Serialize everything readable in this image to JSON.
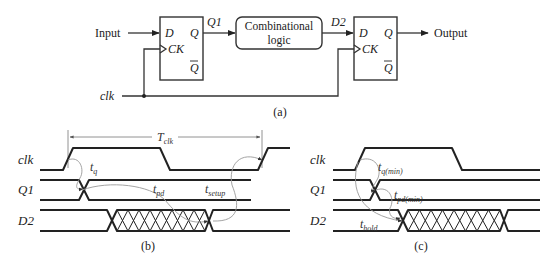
{
  "circuit": {
    "input_label": "Input",
    "output_label": "Output",
    "clk_label": "clk",
    "ff1": {
      "d": "D",
      "q": "Q",
      "ck": "CK",
      "qbar": "Q"
    },
    "ff2": {
      "d": "D",
      "q": "Q",
      "ck": "CK",
      "qbar": "Q"
    },
    "q1_label": "Q1",
    "d2_label": "D2",
    "logic_line1": "Combinational",
    "logic_line2": "logic",
    "caption": "(a)"
  },
  "timing_b": {
    "signals": [
      "clk",
      "Q1",
      "D2"
    ],
    "period_label": "T",
    "period_sub": "clk",
    "tq": "t",
    "tq_sub": "q",
    "tpd": "t",
    "tpd_sub": "pd",
    "tsetup": "t",
    "tsetup_sub": "setup",
    "caption": "(b)"
  },
  "timing_c": {
    "signals": [
      "clk",
      "Q1",
      "D2"
    ],
    "tq": "t",
    "tq_sub": "q(min)",
    "tpd": "t",
    "tpd_sub": "pd(min)",
    "thold": "t",
    "thold_sub": "hold",
    "caption": "(c)"
  }
}
